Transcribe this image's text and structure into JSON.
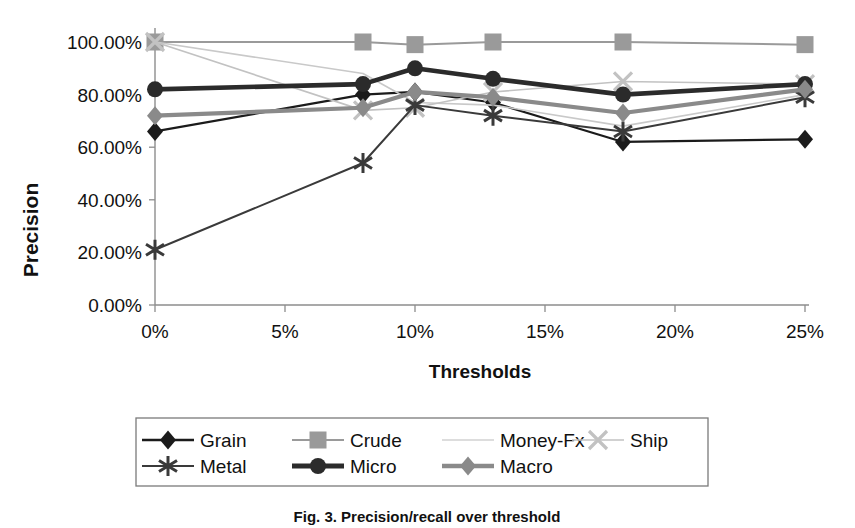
{
  "chart_data": {
    "type": "line",
    "title": "",
    "xlabel": "Thresholds",
    "ylabel": "Precision",
    "x": [
      0,
      8,
      10,
      13,
      18,
      25
    ],
    "xtick_labels": [
      "0%",
      "5%",
      "10%",
      "15%",
      "20%",
      "25%"
    ],
    "xtick_values": [
      0,
      5,
      10,
      15,
      20,
      25
    ],
    "ytick_labels": [
      "0.00%",
      "20.00%",
      "40.00%",
      "60.00%",
      "80.00%",
      "100.00%"
    ],
    "ytick_values": [
      0,
      20,
      40,
      60,
      80,
      100
    ],
    "xlim": [
      0,
      25
    ],
    "ylim": [
      0,
      100
    ],
    "grid": false,
    "legend_position": "bottom",
    "series": [
      {
        "name": "Grain",
        "marker": "diamond",
        "color": "#1b1b1b",
        "width": 2.2,
        "values": [
          66,
          80,
          81,
          77,
          62,
          63
        ]
      },
      {
        "name": "Crude",
        "marker": "square",
        "color": "#9a9a9a",
        "width": 2.0,
        "values": [
          100,
          100,
          99,
          100,
          100,
          99
        ]
      },
      {
        "name": "Money-Fx",
        "marker": "none",
        "color": "#c9c9c9",
        "width": 1.6,
        "values": [
          100,
          88,
          77,
          76,
          68,
          80
        ]
      },
      {
        "name": "Ship",
        "marker": "cross",
        "color": "#c2c2c2",
        "width": 1.6,
        "values": [
          100,
          74,
          75,
          81,
          85,
          84
        ]
      },
      {
        "name": "Metal",
        "marker": "asterisk",
        "color": "#3a3a3a",
        "width": 2.0,
        "values": [
          21,
          54,
          76,
          72,
          66,
          79
        ]
      },
      {
        "name": "Micro",
        "marker": "circle",
        "color": "#2b2b2b",
        "width": 4.6,
        "values": [
          82,
          84,
          90,
          86,
          80,
          84
        ]
      },
      {
        "name": "Macro",
        "marker": "diamond",
        "color": "#8a8a8a",
        "width": 4.2,
        "values": [
          72,
          75,
          81,
          79,
          73,
          82
        ]
      }
    ]
  },
  "legend": {
    "rows": [
      [
        {
          "label": "Grain",
          "marker": "diamond",
          "color": "#1b1b1b",
          "width": 2.4
        },
        {
          "label": "Crude",
          "marker": "square",
          "color": "#9a9a9a",
          "width": 2.2
        },
        {
          "label": "Money-Fx",
          "marker": "none",
          "color": "#d2d2d2",
          "width": 1.6
        },
        {
          "label": "Ship",
          "marker": "cross",
          "color": "#c2c2c2",
          "width": 1.6
        }
      ],
      [
        {
          "label": "Metal",
          "marker": "asterisk",
          "color": "#3a3a3a",
          "width": 2.0
        },
        {
          "label": "Micro",
          "marker": "circle",
          "color": "#2b2b2b",
          "width": 4.8
        },
        {
          "label": "Macro",
          "marker": "diamond",
          "color": "#8a8a8a",
          "width": 4.6
        }
      ]
    ]
  },
  "caption": {
    "text": "Fig. 3. Precision/recall over threshold"
  }
}
